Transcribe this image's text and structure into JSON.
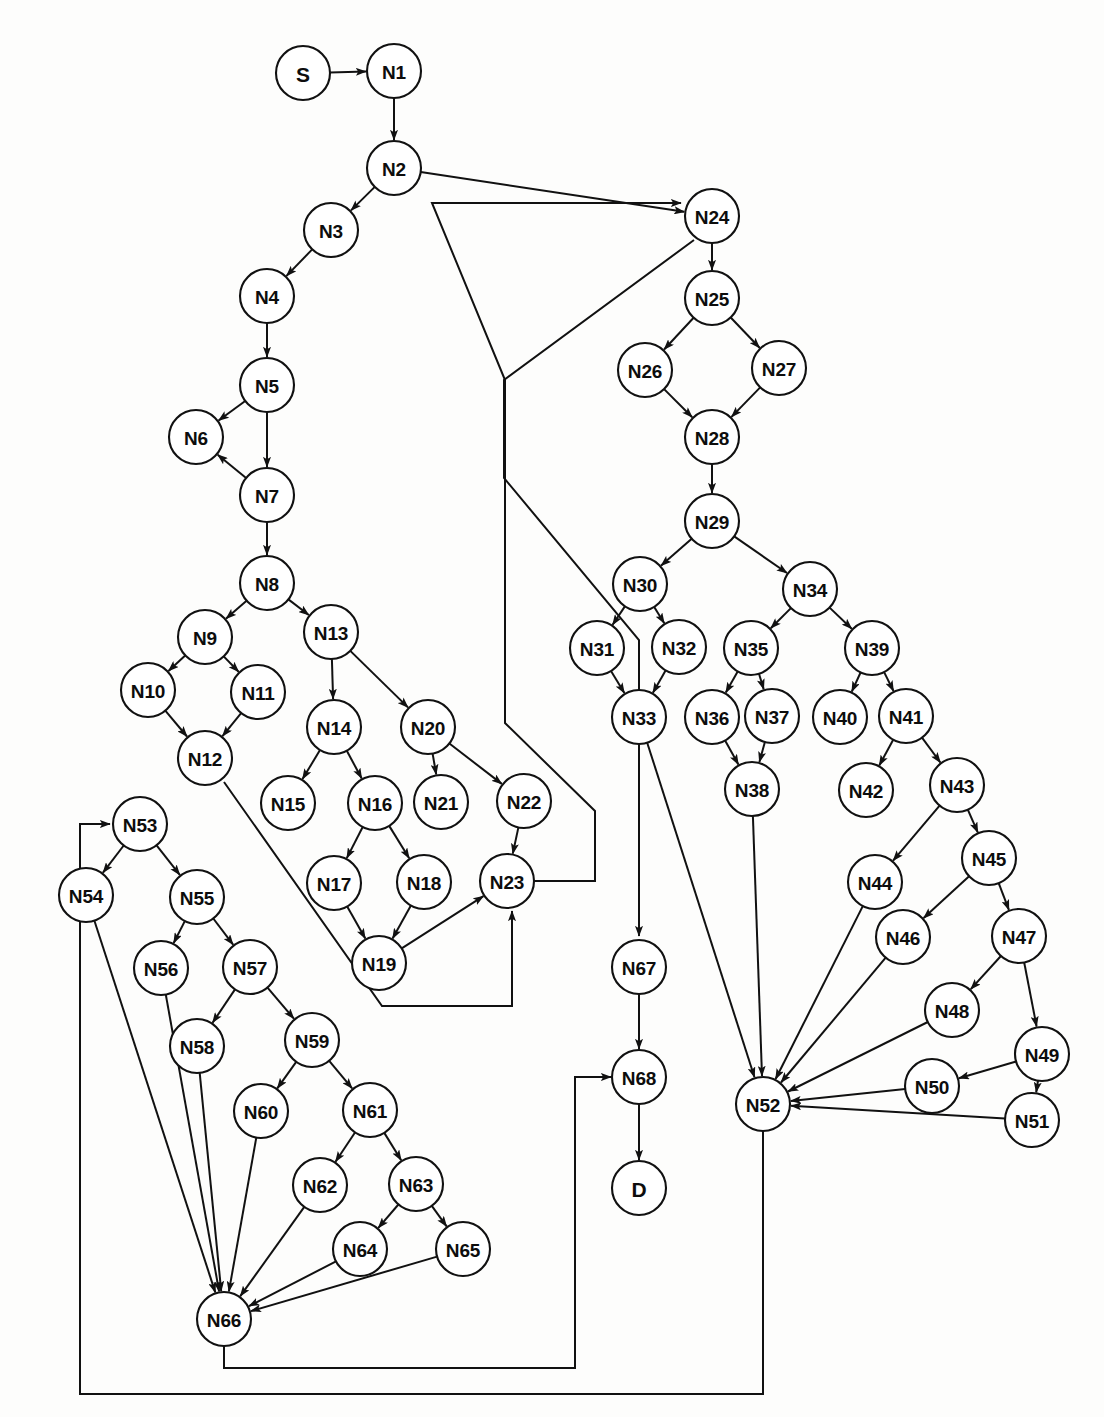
{
  "diagram": {
    "type": "directed-graph",
    "node_radius": 27,
    "terminal_radius": 27,
    "stroke_color": "#111111",
    "node_fill": "#ffffff",
    "background": "#fdfdfc",
    "node_count": 70,
    "edge_count": 78
  },
  "nodes": [
    {
      "id": "S",
      "label": "S",
      "x": 303,
      "y": 73,
      "kind": "terminal"
    },
    {
      "id": "N1",
      "label": "N1",
      "x": 394,
      "y": 71,
      "kind": "normal"
    },
    {
      "id": "N2",
      "label": "N2",
      "x": 394,
      "y": 168,
      "kind": "normal"
    },
    {
      "id": "N3",
      "label": "N3",
      "x": 331,
      "y": 230,
      "kind": "normal"
    },
    {
      "id": "N4",
      "label": "N4",
      "x": 267,
      "y": 296,
      "kind": "normal"
    },
    {
      "id": "N5",
      "label": "N5",
      "x": 267,
      "y": 385,
      "kind": "normal"
    },
    {
      "id": "N6",
      "label": "N6",
      "x": 196,
      "y": 437,
      "kind": "normal"
    },
    {
      "id": "N7",
      "label": "N7",
      "x": 267,
      "y": 495,
      "kind": "normal"
    },
    {
      "id": "N8",
      "label": "N8",
      "x": 267,
      "y": 583,
      "kind": "normal"
    },
    {
      "id": "N9",
      "label": "N9",
      "x": 205,
      "y": 637,
      "kind": "normal"
    },
    {
      "id": "N10",
      "label": "N10",
      "x": 148,
      "y": 690,
      "kind": "normal"
    },
    {
      "id": "N11",
      "label": "N11",
      "x": 258,
      "y": 692,
      "kind": "normal"
    },
    {
      "id": "N12",
      "label": "N12",
      "x": 205,
      "y": 758,
      "kind": "normal"
    },
    {
      "id": "N13",
      "label": "N13",
      "x": 331,
      "y": 632,
      "kind": "normal"
    },
    {
      "id": "N14",
      "label": "N14",
      "x": 334,
      "y": 727,
      "kind": "normal"
    },
    {
      "id": "N15",
      "label": "N15",
      "x": 288,
      "y": 803,
      "kind": "normal"
    },
    {
      "id": "N16",
      "label": "N16",
      "x": 375,
      "y": 803,
      "kind": "normal"
    },
    {
      "id": "N17",
      "label": "N17",
      "x": 334,
      "y": 883,
      "kind": "normal"
    },
    {
      "id": "N18",
      "label": "N18",
      "x": 424,
      "y": 882,
      "kind": "normal"
    },
    {
      "id": "N19",
      "label": "N19",
      "x": 379,
      "y": 963,
      "kind": "normal"
    },
    {
      "id": "N20",
      "label": "N20",
      "x": 428,
      "y": 727,
      "kind": "normal"
    },
    {
      "id": "N21",
      "label": "N21",
      "x": 441,
      "y": 802,
      "kind": "normal"
    },
    {
      "id": "N22",
      "label": "N22",
      "x": 524,
      "y": 801,
      "kind": "normal"
    },
    {
      "id": "N23",
      "label": "N23",
      "x": 507,
      "y": 881,
      "kind": "normal"
    },
    {
      "id": "N24",
      "label": "N24",
      "x": 712,
      "y": 216,
      "kind": "normal"
    },
    {
      "id": "N25",
      "label": "N25",
      "x": 712,
      "y": 298,
      "kind": "normal"
    },
    {
      "id": "N26",
      "label": "N26",
      "x": 645,
      "y": 370,
      "kind": "normal"
    },
    {
      "id": "N27",
      "label": "N27",
      "x": 779,
      "y": 368,
      "kind": "normal"
    },
    {
      "id": "N28",
      "label": "N28",
      "x": 712,
      "y": 437,
      "kind": "normal"
    },
    {
      "id": "N29",
      "label": "N29",
      "x": 712,
      "y": 521,
      "kind": "normal"
    },
    {
      "id": "N30",
      "label": "N30",
      "x": 640,
      "y": 584,
      "kind": "normal"
    },
    {
      "id": "N31",
      "label": "N31",
      "x": 597,
      "y": 648,
      "kind": "normal"
    },
    {
      "id": "N32",
      "label": "N32",
      "x": 679,
      "y": 647,
      "kind": "normal"
    },
    {
      "id": "N33",
      "label": "N33",
      "x": 639,
      "y": 717,
      "kind": "normal"
    },
    {
      "id": "N34",
      "label": "N34",
      "x": 810,
      "y": 589,
      "kind": "normal"
    },
    {
      "id": "N35",
      "label": "N35",
      "x": 751,
      "y": 648,
      "kind": "normal"
    },
    {
      "id": "N36",
      "label": "N36",
      "x": 712,
      "y": 717,
      "kind": "normal"
    },
    {
      "id": "N37",
      "label": "N37",
      "x": 772,
      "y": 716,
      "kind": "normal"
    },
    {
      "id": "N38",
      "label": "N38",
      "x": 752,
      "y": 789,
      "kind": "normal"
    },
    {
      "id": "N39",
      "label": "N39",
      "x": 872,
      "y": 648,
      "kind": "normal"
    },
    {
      "id": "N40",
      "label": "N40",
      "x": 840,
      "y": 717,
      "kind": "normal"
    },
    {
      "id": "N41",
      "label": "N41",
      "x": 906,
      "y": 716,
      "kind": "normal"
    },
    {
      "id": "N42",
      "label": "N42",
      "x": 866,
      "y": 790,
      "kind": "normal"
    },
    {
      "id": "N43",
      "label": "N43",
      "x": 957,
      "y": 785,
      "kind": "normal"
    },
    {
      "id": "N44",
      "label": "N44",
      "x": 875,
      "y": 882,
      "kind": "normal"
    },
    {
      "id": "N45",
      "label": "N45",
      "x": 989,
      "y": 858,
      "kind": "normal"
    },
    {
      "id": "N46",
      "label": "N46",
      "x": 903,
      "y": 937,
      "kind": "normal"
    },
    {
      "id": "N47",
      "label": "N47",
      "x": 1019,
      "y": 936,
      "kind": "normal"
    },
    {
      "id": "N48",
      "label": "N48",
      "x": 952,
      "y": 1010,
      "kind": "normal"
    },
    {
      "id": "N49",
      "label": "N49",
      "x": 1042,
      "y": 1054,
      "kind": "normal"
    },
    {
      "id": "N50",
      "label": "N50",
      "x": 932,
      "y": 1086,
      "kind": "normal"
    },
    {
      "id": "N51",
      "label": "N51",
      "x": 1032,
      "y": 1120,
      "kind": "normal"
    },
    {
      "id": "N52",
      "label": "N52",
      "x": 763,
      "y": 1104,
      "kind": "normal"
    },
    {
      "id": "N53",
      "label": "N53",
      "x": 140,
      "y": 824,
      "kind": "normal"
    },
    {
      "id": "N54",
      "label": "N54",
      "x": 86,
      "y": 895,
      "kind": "normal"
    },
    {
      "id": "N55",
      "label": "N55",
      "x": 197,
      "y": 897,
      "kind": "normal"
    },
    {
      "id": "N56",
      "label": "N56",
      "x": 161,
      "y": 968,
      "kind": "normal"
    },
    {
      "id": "N57",
      "label": "N57",
      "x": 250,
      "y": 967,
      "kind": "normal"
    },
    {
      "id": "N58",
      "label": "N58",
      "x": 197,
      "y": 1046,
      "kind": "normal"
    },
    {
      "id": "N59",
      "label": "N59",
      "x": 312,
      "y": 1040,
      "kind": "normal"
    },
    {
      "id": "N60",
      "label": "N60",
      "x": 261,
      "y": 1111,
      "kind": "normal"
    },
    {
      "id": "N61",
      "label": "N61",
      "x": 370,
      "y": 1110,
      "kind": "normal"
    },
    {
      "id": "N62",
      "label": "N62",
      "x": 320,
      "y": 1185,
      "kind": "normal"
    },
    {
      "id": "N63",
      "label": "N63",
      "x": 416,
      "y": 1184,
      "kind": "normal"
    },
    {
      "id": "N64",
      "label": "N64",
      "x": 360,
      "y": 1249,
      "kind": "normal"
    },
    {
      "id": "N65",
      "label": "N65",
      "x": 463,
      "y": 1249,
      "kind": "normal"
    },
    {
      "id": "N66",
      "label": "N66",
      "x": 224,
      "y": 1319,
      "kind": "normal"
    },
    {
      "id": "N67",
      "label": "N67",
      "x": 639,
      "y": 967,
      "kind": "normal"
    },
    {
      "id": "N68",
      "label": "N68",
      "x": 639,
      "y": 1077,
      "kind": "normal"
    },
    {
      "id": "D",
      "label": "D",
      "x": 639,
      "y": 1188,
      "kind": "terminal"
    }
  ],
  "edges": [
    {
      "from": "S",
      "to": "N1"
    },
    {
      "from": "N1",
      "to": "N2"
    },
    {
      "from": "N2",
      "to": "N3"
    },
    {
      "from": "N2",
      "to": "N24"
    },
    {
      "from": "N3",
      "to": "N4"
    },
    {
      "from": "N4",
      "to": "N5"
    },
    {
      "from": "N5",
      "to": "N6"
    },
    {
      "from": "N5",
      "to": "N7"
    },
    {
      "from": "N7",
      "to": "N6"
    },
    {
      "from": "N7",
      "to": "N8"
    },
    {
      "from": "N8",
      "to": "N9"
    },
    {
      "from": "N8",
      "to": "N13"
    },
    {
      "from": "N9",
      "to": "N10"
    },
    {
      "from": "N9",
      "to": "N11"
    },
    {
      "from": "N10",
      "to": "N12"
    },
    {
      "from": "N11",
      "to": "N12"
    },
    {
      "from": "N12",
      "to": "N23",
      "route": "poly",
      "points": [
        [
          224,
          782
        ],
        [
          382,
          1006
        ],
        [
          512,
          1006
        ],
        [
          512,
          911
        ]
      ]
    },
    {
      "from": "N13",
      "to": "N14"
    },
    {
      "from": "N13",
      "to": "N20"
    },
    {
      "from": "N14",
      "to": "N15"
    },
    {
      "from": "N14",
      "to": "N16"
    },
    {
      "from": "N16",
      "to": "N17"
    },
    {
      "from": "N16",
      "to": "N18"
    },
    {
      "from": "N17",
      "to": "N19"
    },
    {
      "from": "N18",
      "to": "N19"
    },
    {
      "from": "N19",
      "to": "N23"
    },
    {
      "from": "N20",
      "to": "N21"
    },
    {
      "from": "N20",
      "to": "N22"
    },
    {
      "from": "N22",
      "to": "N23"
    },
    {
      "from": "N23",
      "to": "N24",
      "route": "poly",
      "points": [
        [
          534,
          881
        ],
        [
          595,
          881
        ],
        [
          595,
          811
        ],
        [
          505,
          723
        ],
        [
          505,
          380
        ],
        [
          432,
          203
        ],
        [
          681,
          203
        ]
      ]
    },
    {
      "from": "N24",
      "to": "N25"
    },
    {
      "from": "N25",
      "to": "N26"
    },
    {
      "from": "N25",
      "to": "N27"
    },
    {
      "from": "N26",
      "to": "N28"
    },
    {
      "from": "N27",
      "to": "N28"
    },
    {
      "from": "N28",
      "to": "N29"
    },
    {
      "from": "N29",
      "to": "N30"
    },
    {
      "from": "N29",
      "to": "N34"
    },
    {
      "from": "N30",
      "to": "N31"
    },
    {
      "from": "N30",
      "to": "N32"
    },
    {
      "from": "N31",
      "to": "N33"
    },
    {
      "from": "N32",
      "to": "N33"
    },
    {
      "from": "N33",
      "to": "N52"
    },
    {
      "from": "N34",
      "to": "N35"
    },
    {
      "from": "N34",
      "to": "N39"
    },
    {
      "from": "N35",
      "to": "N36"
    },
    {
      "from": "N35",
      "to": "N37"
    },
    {
      "from": "N36",
      "to": "N38"
    },
    {
      "from": "N37",
      "to": "N38"
    },
    {
      "from": "N38",
      "to": "N52"
    },
    {
      "from": "N39",
      "to": "N40"
    },
    {
      "from": "N39",
      "to": "N41"
    },
    {
      "from": "N41",
      "to": "N42"
    },
    {
      "from": "N41",
      "to": "N43"
    },
    {
      "from": "N43",
      "to": "N44"
    },
    {
      "from": "N43",
      "to": "N45"
    },
    {
      "from": "N44",
      "to": "N52"
    },
    {
      "from": "N45",
      "to": "N46"
    },
    {
      "from": "N45",
      "to": "N47"
    },
    {
      "from": "N46",
      "to": "N52"
    },
    {
      "from": "N47",
      "to": "N48"
    },
    {
      "from": "N47",
      "to": "N49"
    },
    {
      "from": "N48",
      "to": "N52"
    },
    {
      "from": "N49",
      "to": "N50"
    },
    {
      "from": "N49",
      "to": "N51"
    },
    {
      "from": "N50",
      "to": "N52"
    },
    {
      "from": "N51",
      "to": "N52"
    },
    {
      "from": "N24",
      "to": "N67",
      "route": "poly",
      "points": [
        [
          694,
          240
        ],
        [
          504,
          380
        ],
        [
          504,
          478
        ],
        [
          639,
          640
        ],
        [
          639,
          936
        ]
      ]
    },
    {
      "from": "N52",
      "to": "N53",
      "route": "poly",
      "points": [
        [
          763,
          1131
        ],
        [
          763,
          1394
        ],
        [
          80,
          1394
        ],
        [
          80,
          824
        ],
        [
          110,
          824
        ]
      ]
    },
    {
      "from": "N53",
      "to": "N54"
    },
    {
      "from": "N53",
      "to": "N55"
    },
    {
      "from": "N54",
      "to": "N66"
    },
    {
      "from": "N55",
      "to": "N56"
    },
    {
      "from": "N55",
      "to": "N57"
    },
    {
      "from": "N56",
      "to": "N66"
    },
    {
      "from": "N57",
      "to": "N58"
    },
    {
      "from": "N57",
      "to": "N59"
    },
    {
      "from": "N58",
      "to": "N66"
    },
    {
      "from": "N59",
      "to": "N60"
    },
    {
      "from": "N59",
      "to": "N61"
    },
    {
      "from": "N60",
      "to": "N66"
    },
    {
      "from": "N61",
      "to": "N62"
    },
    {
      "from": "N61",
      "to": "N63"
    },
    {
      "from": "N62",
      "to": "N66"
    },
    {
      "from": "N63",
      "to": "N64"
    },
    {
      "from": "N63",
      "to": "N65"
    },
    {
      "from": "N64",
      "to": "N66"
    },
    {
      "from": "N65",
      "to": "N66"
    },
    {
      "from": "N66",
      "to": "N68",
      "route": "poly",
      "points": [
        [
          224,
          1346
        ],
        [
          224,
          1368
        ],
        [
          575,
          1368
        ],
        [
          575,
          1077
        ],
        [
          612,
          1077
        ]
      ]
    },
    {
      "from": "N67",
      "to": "N68"
    },
    {
      "from": "N68",
      "to": "D"
    }
  ]
}
